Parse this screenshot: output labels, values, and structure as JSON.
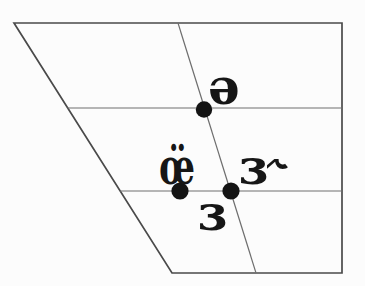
{
  "diagram": {
    "labels": {
      "schwa": "ə",
      "oe_diaeresis": "œ̈",
      "rhotic_er": "ɜ˞",
      "open_mid_central": "ɜ"
    },
    "colors": {
      "background": "#fcfcfc",
      "outline": "#4a4a4a",
      "inner_line": "#6e6e6e",
      "dot": "#141414",
      "text": "#161616"
    }
  }
}
